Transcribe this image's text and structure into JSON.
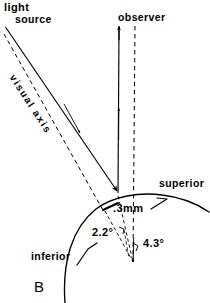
{
  "figure": {
    "panel_letter": "B",
    "description_title": "Corneal light reflex and visual axis geometry",
    "background_color": "#ffffff",
    "ink_color": "#000000"
  },
  "labels": {
    "light_source_line1": "light",
    "light_source_line2": "source",
    "observer": "observer",
    "visual_axis": "visual axis",
    "superior": "superior",
    "inferior": "inferior",
    "offset_distance": ".3mm",
    "angle_small": "2.2°",
    "angle_large": "4.3°"
  },
  "measurements": {
    "corneal_offset_mm": 0.3,
    "angle_small_degrees": 2.2,
    "angle_large_degrees": 4.3,
    "angle_units": "degrees",
    "distance_units": "mm"
  },
  "geometry": {
    "corneal_apex": {
      "x": 122,
      "y": 198
    },
    "rotation_center": {
      "x": 133,
      "y": 262
    },
    "light_source_origin": {
      "x": 5,
      "y": 27
    },
    "observer_direction": {
      "x": 118,
      "y": 28
    },
    "reflection_point": {
      "x": 118,
      "y": 193
    }
  },
  "line_styles": {
    "solid_ray": "solid",
    "visual_axis": "dashed",
    "optical_axis": "dashed",
    "angle_construction": "dashed"
  }
}
